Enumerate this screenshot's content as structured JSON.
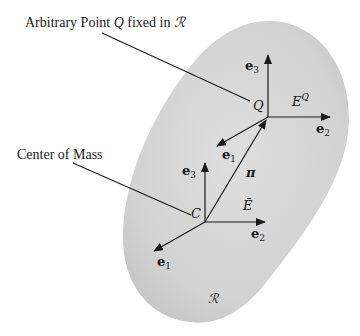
{
  "figure": {
    "captions": {
      "point_q": "Arbitrary Point Q fixed in ℛ",
      "point_q_prefix": "Arbitrary Point ",
      "point_q_var": "Q",
      "point_q_suffix": " fixed in ",
      "point_q_body": "ℛ",
      "center_of_mass": "Center of Mass"
    },
    "body": {
      "label": "ℛ",
      "fill_color": "#d4d4d4"
    },
    "frame_q": {
      "origin_label": "Q",
      "frame_label_base": "E",
      "frame_label_sup": "Q",
      "axes": [
        {
          "name": "e",
          "sub": "1"
        },
        {
          "name": "e",
          "sub": "2"
        },
        {
          "name": "e",
          "sub": "3"
        }
      ]
    },
    "frame_c": {
      "origin_label": "C",
      "frame_label": "Ē",
      "axes": [
        {
          "name": "e",
          "sub": "1"
        },
        {
          "name": "e",
          "sub": "2"
        },
        {
          "name": "e",
          "sub": "3"
        }
      ]
    },
    "position_vector": {
      "label": "π"
    }
  }
}
